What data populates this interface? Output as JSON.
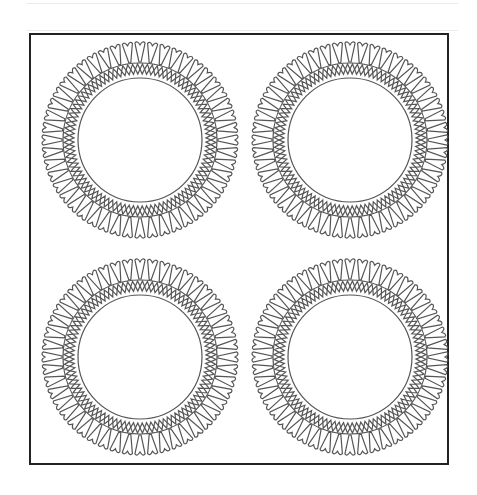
{
  "page": {
    "type": "coloring-page",
    "colors": {
      "line": "#555555",
      "frame": "#222222",
      "background": "#ffffff",
      "rule": "#ececec"
    }
  },
  "medallions": [
    {
      "id": "top-left",
      "cx": 140,
      "cy": 140
    },
    {
      "id": "top-right",
      "cx": 350,
      "cy": 140
    },
    {
      "id": "bottom-left",
      "cx": 140,
      "cy": 357
    },
    {
      "id": "bottom-right",
      "cx": 350,
      "cy": 357
    }
  ],
  "medallion_style": {
    "petal_count": 48,
    "outer_radius": 99,
    "petal_inner_radius": 78,
    "braid_outer_radius": 76,
    "braid_inner_radius": 66,
    "braid_cells": 48,
    "inner_circle_radius": 62
  }
}
